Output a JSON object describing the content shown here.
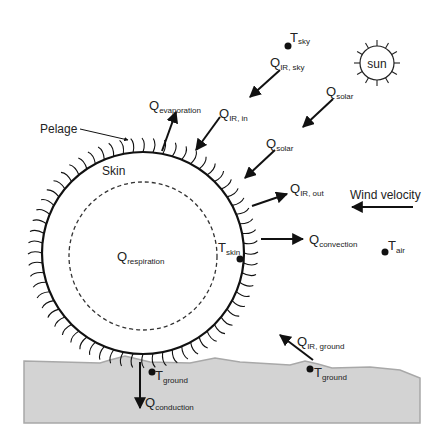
{
  "labels": {
    "pelage": "Pelage",
    "skin": "Skin",
    "sun": "sun",
    "wind_velocity": "Wind velocity"
  },
  "quantities": {
    "q_evaporation": {
      "symbol": "Q",
      "sub": "evaporation"
    },
    "q_ir_sky": {
      "symbol": "Q",
      "sub": "IR, sky"
    },
    "q_ir_in": {
      "symbol": "Q",
      "sub": "IR, in"
    },
    "q_solar_top": {
      "symbol": "Q",
      "sub": "solar"
    },
    "q_solar_mid": {
      "symbol": "Q",
      "sub": "solar"
    },
    "q_ir_out": {
      "symbol": "Q",
      "sub": "IR, out"
    },
    "q_convection": {
      "symbol": "Q",
      "sub": "convection"
    },
    "q_respiration": {
      "symbol": "Q",
      "sub": "respiration"
    },
    "q_ir_ground": {
      "symbol": "Q",
      "sub": "IR, ground"
    },
    "q_conduction": {
      "symbol": "Q",
      "sub": "conduction"
    }
  },
  "temperatures": {
    "t_sky": {
      "symbol": "T",
      "sub": "sky"
    },
    "t_skin": {
      "symbol": "T",
      "sub": "skin"
    },
    "t_air": {
      "symbol": "T",
      "sub": "air"
    },
    "t_ground_left": {
      "symbol": "T",
      "sub": "ground"
    },
    "t_ground_right": {
      "symbol": "T",
      "sub": "ground"
    }
  },
  "colors": {
    "ground_fill": "#d3d3d3",
    "ground_stroke": "#a8a8a8",
    "line": "#111111",
    "text": "#222222"
  }
}
